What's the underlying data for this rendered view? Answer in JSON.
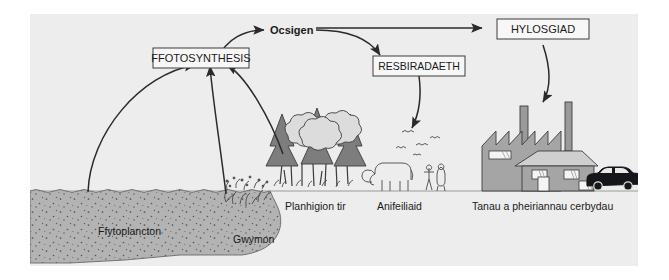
{
  "diagram": {
    "background_color": "#ededed",
    "page_color": "#ffffff",
    "water_color": "#b3b3b3",
    "ink_color": "#1a1a1a"
  },
  "boxes": [
    {
      "id": "ffotosynthesis",
      "label": "FFOTOSYNTHESIS"
    },
    {
      "id": "resbiradaeth",
      "label": "RESBIRADAETH"
    },
    {
      "id": "hylosgiad",
      "label": "HYLOSGIAD"
    }
  ],
  "free_labels": [
    {
      "id": "ocsigen",
      "label": "Ocsigen",
      "bold": true
    }
  ],
  "scene_labels": [
    {
      "id": "ffytoplancton",
      "label": "Ffytoplancton"
    },
    {
      "id": "gwymon",
      "label": "Gwymon"
    },
    {
      "id": "planhigion-tir",
      "label": "Planhigion tir"
    },
    {
      "id": "anifeiliaid",
      "label": "Anifeiliaid"
    },
    {
      "id": "tanau-cerbydau",
      "label": "Tanau a pheiriannau cerbydau"
    }
  ],
  "arrows": [
    {
      "id": "ffotosynthesis-to-ocsigen",
      "from": "FFOTOSYNTHESIS",
      "to": "Ocsigen"
    },
    {
      "id": "ocsigen-to-resbiradaeth",
      "from": "Ocsigen",
      "to": "RESBIRADAETH"
    },
    {
      "id": "ocsigen-to-hylosgiad",
      "from": "Ocsigen",
      "to": "HYLOSGIAD"
    },
    {
      "id": "hylosgiad-to-factory",
      "from": "HYLOSGIAD",
      "to": "Tanau a pheiriannau cerbydau"
    },
    {
      "id": "resbiradaeth-to-anifeiliaid",
      "from": "RESBIRADAETH",
      "to": "Anifeiliaid"
    },
    {
      "id": "ffytoplancton-to-ffotosynthesis",
      "from": "Ffytoplancton",
      "to": "FFOTOSYNTHESIS"
    },
    {
      "id": "gwymon-to-ffotosynthesis",
      "from": "Gwymon",
      "to": "FFOTOSYNTHESIS"
    },
    {
      "id": "planhigion-to-ffotosynthesis",
      "from": "Planhigion tir",
      "to": "FFOTOSYNTHESIS"
    }
  ]
}
